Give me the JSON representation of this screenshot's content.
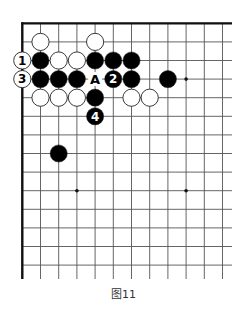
{
  "diagram": {
    "type": "go-board-partial",
    "caption": "图11",
    "grid": {
      "origin_x": 22.3,
      "origin_y": 23.3,
      "step_x": 18.2,
      "step_y": 18.6,
      "cols": 12,
      "rows": 14,
      "extend_right_to": 232,
      "extend_bottom_to": 279,
      "edges": [
        "top",
        "left"
      ]
    },
    "colors": {
      "line": "#555555",
      "edge": "#111111",
      "black_stone": "#000000",
      "white_stone": "#ffffff",
      "stone_outline": "#222222"
    },
    "star_points": [
      {
        "col": 3,
        "row": 3
      },
      {
        "col": 9,
        "row": 3
      },
      {
        "col": 3,
        "row": 9
      },
      {
        "col": 9,
        "row": 9
      }
    ],
    "stones": [
      {
        "col": 1,
        "row": 1,
        "color": "white"
      },
      {
        "col": 4,
        "row": 1,
        "color": "white"
      },
      {
        "col": 0,
        "row": 2,
        "color": "white",
        "label": "1"
      },
      {
        "col": 1,
        "row": 2,
        "color": "black"
      },
      {
        "col": 2,
        "row": 2,
        "color": "white"
      },
      {
        "col": 3,
        "row": 2,
        "color": "white"
      },
      {
        "col": 4,
        "row": 2,
        "color": "black"
      },
      {
        "col": 5,
        "row": 2,
        "color": "black"
      },
      {
        "col": 6,
        "row": 2,
        "color": "black"
      },
      {
        "col": 0,
        "row": 3,
        "color": "white",
        "label": "3"
      },
      {
        "col": 1,
        "row": 3,
        "color": "black"
      },
      {
        "col": 2,
        "row": 3,
        "color": "black"
      },
      {
        "col": 3,
        "row": 3,
        "color": "black"
      },
      {
        "col": 5,
        "row": 3,
        "color": "black",
        "label": "2"
      },
      {
        "col": 6,
        "row": 3,
        "color": "black"
      },
      {
        "col": 8,
        "row": 3,
        "color": "black"
      },
      {
        "col": 1,
        "row": 4,
        "color": "white"
      },
      {
        "col": 2,
        "row": 4,
        "color": "white"
      },
      {
        "col": 3,
        "row": 4,
        "color": "white"
      },
      {
        "col": 4,
        "row": 4,
        "color": "black"
      },
      {
        "col": 6,
        "row": 4,
        "color": "white"
      },
      {
        "col": 7,
        "row": 4,
        "color": "white"
      },
      {
        "col": 4,
        "row": 5,
        "color": "black",
        "label": "4"
      },
      {
        "col": 2,
        "row": 7,
        "color": "black"
      }
    ],
    "markers": [
      {
        "col": 4,
        "row": 3,
        "label": "A"
      }
    ]
  }
}
